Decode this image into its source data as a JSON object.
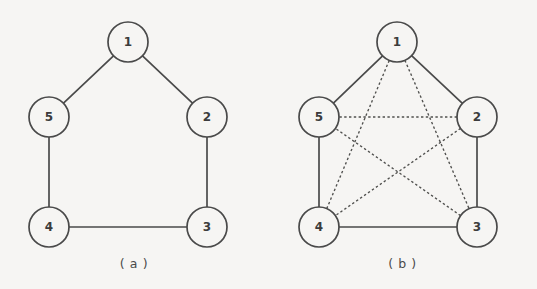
{
  "figure": {
    "background_color": "#f6f5f3",
    "stroke_color": "#4a4a4a",
    "node_radius": 20,
    "panels": [
      {
        "id": "a",
        "caption": "( a )",
        "nodes": [
          {
            "label": "1",
            "x": 128,
            "y": 42
          },
          {
            "label": "2",
            "x": 207,
            "y": 117
          },
          {
            "label": "3",
            "x": 207,
            "y": 227
          },
          {
            "label": "4",
            "x": 49,
            "y": 227
          },
          {
            "label": "5",
            "x": 49,
            "y": 117
          }
        ],
        "solid_edges": [
          {
            "from": "1",
            "to": "5"
          },
          {
            "from": "1",
            "to": "2"
          },
          {
            "from": "2",
            "to": "3"
          },
          {
            "from": "3",
            "to": "4"
          },
          {
            "from": "4",
            "to": "5"
          }
        ],
        "dashed_edges": []
      },
      {
        "id": "b",
        "caption": "( b )",
        "nodes": [
          {
            "label": "1",
            "x": 129,
            "y": 42
          },
          {
            "label": "2",
            "x": 209,
            "y": 117
          },
          {
            "label": "3",
            "x": 209,
            "y": 227
          },
          {
            "label": "4",
            "x": 51,
            "y": 227
          },
          {
            "label": "5",
            "x": 51,
            "y": 117
          }
        ],
        "solid_edges": [
          {
            "from": "1",
            "to": "5"
          },
          {
            "from": "1",
            "to": "2"
          },
          {
            "from": "2",
            "to": "3"
          },
          {
            "from": "3",
            "to": "4"
          },
          {
            "from": "4",
            "to": "5"
          }
        ],
        "dashed_edges": [
          {
            "from": "1",
            "to": "3"
          },
          {
            "from": "1",
            "to": "4"
          },
          {
            "from": "2",
            "to": "4"
          },
          {
            "from": "2",
            "to": "5"
          },
          {
            "from": "3",
            "to": "5"
          }
        ]
      }
    ],
    "caption_y": 268
  }
}
